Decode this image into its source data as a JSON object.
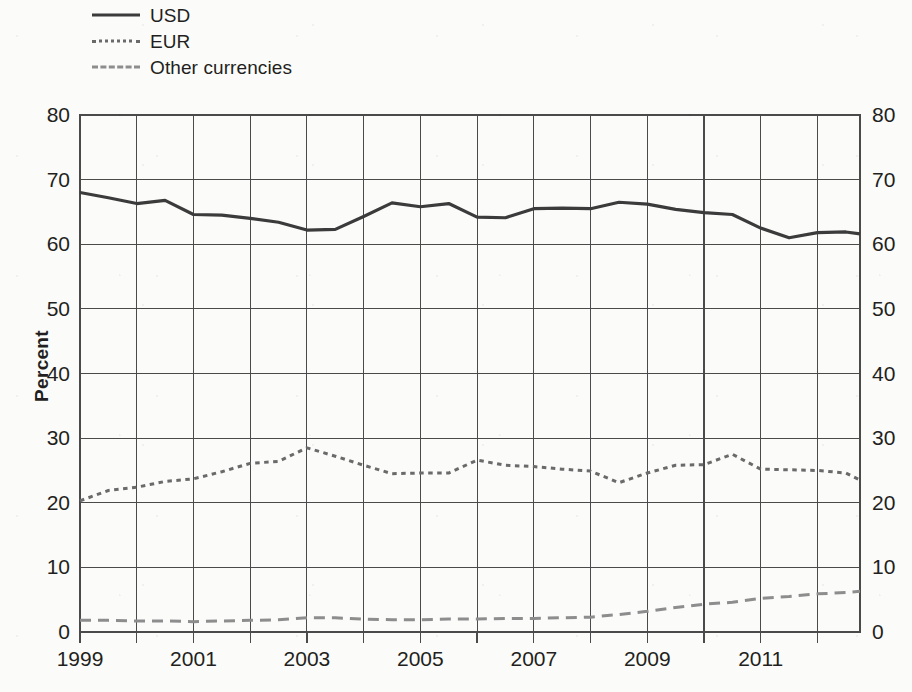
{
  "legend": {
    "position": "top-left",
    "entries": [
      {
        "label": "USD",
        "style": "solid",
        "color": "#3b3b3b"
      },
      {
        "label": "EUR",
        "style": "dotted",
        "color": "#6a6a6a"
      },
      {
        "label": "Other currencies",
        "style": "dashed",
        "color": "#8d8d8d"
      }
    ]
  },
  "axes": {
    "ylabel": "Percent",
    "y_ticks": [
      "0",
      "10",
      "20",
      "30",
      "40",
      "50",
      "60",
      "70",
      "80"
    ],
    "y_ticks_right": [
      "0",
      "10",
      "20",
      "30",
      "40",
      "50",
      "60",
      "70",
      "80"
    ],
    "x_ticks": [
      "1999",
      "2001",
      "2003",
      "2005",
      "2007",
      "2009",
      "2011"
    ]
  },
  "chart_data": {
    "type": "line",
    "title": "",
    "subtitle": "",
    "xlabel": "",
    "ylabel": "Percent",
    "xlim": [
      1999,
      2012.75
    ],
    "ylim": [
      0,
      80
    ],
    "grid": true,
    "legend_position": "top-left",
    "x_tick_labels": [
      "1999",
      "2001",
      "2003",
      "2005",
      "2007",
      "2009",
      "2011"
    ],
    "x_tick_values": [
      1999,
      2001,
      2003,
      2005,
      2007,
      2009,
      2011
    ],
    "y_tick_values": [
      0,
      10,
      20,
      30,
      40,
      50,
      60,
      70,
      80
    ],
    "x": [
      1999,
      1999.5,
      2000,
      2000.5,
      2001,
      2001.5,
      2002,
      2002.5,
      2003,
      2003.5,
      2004,
      2004.5,
      2005,
      2005.5,
      2006,
      2006.5,
      2007,
      2007.5,
      2008,
      2008.5,
      2009,
      2009.5,
      2010,
      2010.5,
      2011,
      2011.5,
      2012,
      2012.5,
      2012.75
    ],
    "series": [
      {
        "name": "USD",
        "style": "solid",
        "color": "#3b3b3b",
        "values": [
          68.0,
          67.2,
          66.3,
          66.8,
          64.6,
          64.5,
          64.0,
          63.4,
          62.2,
          62.3,
          64.3,
          66.4,
          65.8,
          66.3,
          64.2,
          64.1,
          65.5,
          65.6,
          65.5,
          66.5,
          66.2,
          65.4,
          64.9,
          64.6,
          62.5,
          61.0,
          61.8,
          61.9,
          61.6
        ]
      },
      {
        "name": "EUR",
        "style": "dotted",
        "color": "#6a6a6a",
        "values": [
          20.3,
          21.9,
          22.4,
          23.3,
          23.7,
          24.8,
          26.1,
          26.4,
          28.5,
          27.2,
          25.8,
          24.5,
          24.6,
          24.6,
          26.6,
          25.8,
          25.6,
          25.2,
          24.9,
          23.1,
          24.6,
          25.8,
          25.9,
          27.5,
          25.2,
          25.1,
          25.0,
          24.6,
          23.5
        ]
      },
      {
        "name": "Other currencies",
        "style": "dashed",
        "color": "#8d8d8d",
        "values": [
          1.8,
          1.8,
          1.7,
          1.7,
          1.6,
          1.7,
          1.8,
          1.9,
          2.2,
          2.2,
          2.0,
          1.9,
          1.9,
          2.0,
          2.0,
          2.1,
          2.1,
          2.2,
          2.3,
          2.7,
          3.2,
          3.8,
          4.3,
          4.6,
          5.2,
          5.5,
          5.9,
          6.1,
          6.3
        ]
      }
    ]
  }
}
